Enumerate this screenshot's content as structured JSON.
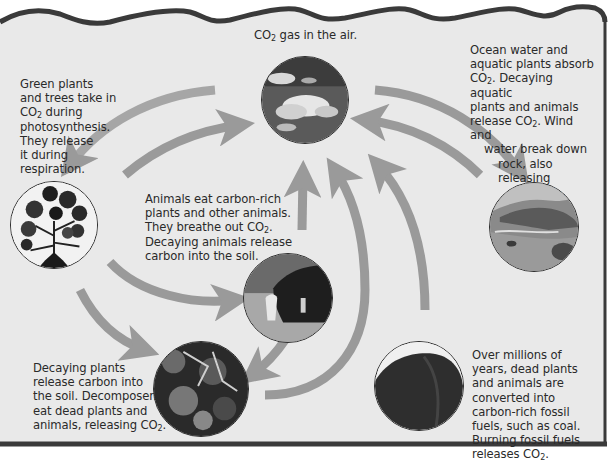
{
  "diagram": {
    "type": "carbon-cycle",
    "colors": {
      "background": "#e9e9e9",
      "border": "#3a3a3a",
      "arrow": "#9a9a9a",
      "text": "#2a2a2a"
    },
    "nodes": {
      "air": {
        "label_pre": "CO",
        "label_sub": "2",
        "label_post": " gas in the air.",
        "image": "clouds-sky"
      },
      "plants": {
        "lines": [
          [
            "Green plants"
          ],
          [
            "and trees take in"
          ],
          [
            "CO",
            "2",
            " during"
          ],
          [
            "photosynthesis."
          ],
          [
            "They release"
          ],
          [
            "it during"
          ],
          [
            "respiration."
          ]
        ],
        "image": "green-plant"
      },
      "ocean": {
        "lines": [
          [
            "Ocean water and"
          ],
          [
            "aquatic plants absorb"
          ],
          [
            "CO",
            "2",
            ". Decaying aquatic"
          ],
          [
            "plants and animals"
          ],
          [
            "release CO",
            "2",
            ". Wind and"
          ],
          [
            "water break down"
          ],
          [
            "rock, also releasing"
          ],
          [
            "CO",
            "2",
            "."
          ]
        ],
        "image": "ocean-coast"
      },
      "animals": {
        "lines": [
          [
            "Animals eat carbon-rich"
          ],
          [
            "plants and other animals."
          ],
          [
            "They breathe out CO",
            "2",
            "."
          ],
          [
            "Decaying animals release"
          ],
          [
            "carbon into the soil."
          ]
        ],
        "image": "grazing-cow"
      },
      "soil": {
        "lines": [
          [
            "Decaying plants"
          ],
          [
            "release carbon into"
          ],
          [
            "the soil. Decomposers"
          ],
          [
            "eat dead plants and"
          ],
          [
            "animals, releasing CO",
            "2",
            "."
          ]
        ],
        "image": "decomposing-soil"
      },
      "fossil": {
        "lines": [
          [
            "Over millions of"
          ],
          [
            "years, dead plants"
          ],
          [
            "and animals are"
          ],
          [
            "converted into"
          ],
          [
            "carbon-rich fossil"
          ],
          [
            "fuels, such as coal."
          ],
          [
            "Burning fossil fuels"
          ],
          [
            "releases CO",
            "2",
            "."
          ]
        ],
        "image": "coal-lump"
      }
    },
    "arrows": [
      {
        "from": "air",
        "to": "plants"
      },
      {
        "from": "plants",
        "to": "air"
      },
      {
        "from": "air",
        "to": "ocean"
      },
      {
        "from": "ocean",
        "to": "air"
      },
      {
        "from": "plants",
        "to": "animals"
      },
      {
        "from": "plants",
        "to": "soil"
      },
      {
        "from": "animals",
        "to": "air"
      },
      {
        "from": "animals",
        "to": "soil"
      },
      {
        "from": "soil",
        "to": "air"
      },
      {
        "from": "fossil",
        "to": "air"
      }
    ]
  }
}
